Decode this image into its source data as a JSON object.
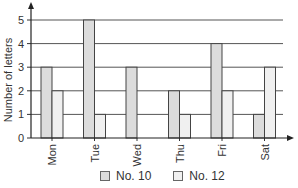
{
  "chart_data": {
    "type": "bar",
    "title": "",
    "xlabel": "",
    "ylabel": "Number of letters",
    "categories": [
      "Mon",
      "Tue",
      "Wed",
      "Thu",
      "Fri",
      "Sat"
    ],
    "series": [
      {
        "name": "No. 10",
        "values": [
          3,
          5,
          3,
          2,
          4,
          1
        ],
        "color": "#dcdcdc"
      },
      {
        "name": "No. 12",
        "values": [
          2,
          1,
          0,
          1,
          2,
          3
        ],
        "color": "#f0f0f0"
      }
    ],
    "yticks": [
      0,
      1,
      2,
      3,
      4,
      5
    ],
    "ylim": [
      0,
      5
    ],
    "grid": true,
    "legend_position": "bottom"
  },
  "legend": {
    "items": [
      {
        "label": "No. 10",
        "color": "#dcdcdc"
      },
      {
        "label": "No. 12",
        "color": "#f0f0f0"
      }
    ]
  }
}
